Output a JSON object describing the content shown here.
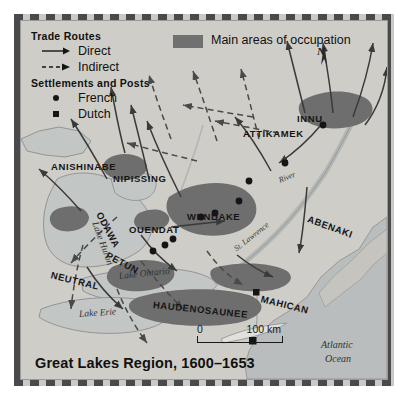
{
  "figure": {
    "title": "Great Lakes Region, 1600–1653",
    "compass_label": "N"
  },
  "legend": {
    "trade_routes": {
      "heading": "Trade Routes",
      "items": [
        {
          "label": "Direct",
          "symbol": "solid-arrow-icon"
        },
        {
          "label": "Indirect",
          "symbol": "dashed-arrow-icon"
        }
      ]
    },
    "settlements": {
      "heading": "Settlements and Posts",
      "items": [
        {
          "label": "French",
          "symbol": "circle-marker-icon"
        },
        {
          "label": "Dutch",
          "symbol": "square-marker-icon"
        }
      ]
    },
    "occupation": {
      "label": "Main areas of occupation",
      "swatch_color": "#707070"
    }
  },
  "scale": {
    "start": "0",
    "end": "100 km"
  },
  "nations": [
    {
      "name": "ANISHINABE",
      "x": 30,
      "y": 140,
      "rotate": 0
    },
    {
      "name": "NIPISSING",
      "x": 92,
      "y": 152,
      "rotate": 0
    },
    {
      "name": "ATTIKAMEK",
      "x": 222,
      "y": 107,
      "rotate": 0
    },
    {
      "name": "ODAWA",
      "x": 78,
      "y": 186,
      "rotate": 62
    },
    {
      "name": "OUENDAT",
      "x": 108,
      "y": 203,
      "rotate": 0
    },
    {
      "name": "PETUN",
      "x": 86,
      "y": 228,
      "rotate": 28
    },
    {
      "name": "NEUTRAL",
      "x": 30,
      "y": 248,
      "rotate": 14
    },
    {
      "name": "ABENAKI",
      "x": 287,
      "y": 192,
      "rotate": 20
    },
    {
      "name": "MAHICAN",
      "x": 240,
      "y": 272,
      "rotate": 14
    },
    {
      "name": "HAUDENOSAUNEE",
      "x": 132,
      "y": 278,
      "rotate": 6
    },
    {
      "name": "WENDAKE",
      "x": 166,
      "y": 190,
      "rotate": 0
    },
    {
      "name": "INNU",
      "x": 276,
      "y": 92,
      "rotate": 0
    }
  ],
  "waters": [
    {
      "name": "Lake Huron",
      "x": 74,
      "y": 196,
      "rotate": 70,
      "size": 9.5
    },
    {
      "name": "Lake Ontario",
      "x": 98,
      "y": 250,
      "rotate": -6,
      "size": 9.5
    },
    {
      "name": "Lake Erie",
      "x": 58,
      "y": 288,
      "rotate": -4,
      "size": 9.5
    },
    {
      "name": "St. Lawrence",
      "x": 214,
      "y": 224,
      "rotate": -38,
      "size": 8
    },
    {
      "name": "River",
      "x": 258,
      "y": 155,
      "rotate": -22,
      "size": 8
    },
    {
      "name": "Atlantic",
      "x": 300,
      "y": 318,
      "rotate": 0,
      "size": 10
    },
    {
      "name": "Ocean",
      "x": 304,
      "y": 332,
      "rotate": 0,
      "size": 10
    }
  ],
  "colors": {
    "paper": "#d4d2cd",
    "land": "#cbc9c3",
    "water": "#bfc3c2",
    "occupation": "#707070",
    "frame": "#8e8e8e",
    "ink": "#151515"
  }
}
